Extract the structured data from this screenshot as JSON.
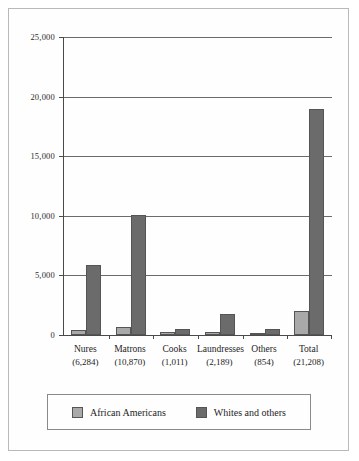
{
  "chart_data": {
    "type": "bar",
    "title": "",
    "xlabel": "",
    "ylabel": "",
    "ylim": [
      0,
      25000
    ],
    "ytick_values": [
      0,
      5000,
      10000,
      15000,
      20000,
      25000
    ],
    "ytick_labels": [
      "0",
      "5,000",
      "10,000",
      "15,000",
      "20,000",
      "25,000"
    ],
    "grid": true,
    "legend_position": "bottom",
    "categories": [
      "Nures",
      "Matrons",
      "Cooks",
      "Laundresses",
      "Others",
      "Total"
    ],
    "category_totals": [
      "(6,284)",
      "(10,870)",
      "(1,011)",
      "(2,189)",
      "(854)",
      "(21,208)"
    ],
    "series": [
      {
        "name": "African Americans",
        "color": "#a9a9a9",
        "values": [
          450,
          700,
          280,
          230,
          130,
          1990
        ]
      },
      {
        "name": "Whites and others",
        "color": "#6b6b6b",
        "values": [
          5834,
          10070,
          480,
          1800,
          480,
          19000
        ]
      }
    ]
  }
}
